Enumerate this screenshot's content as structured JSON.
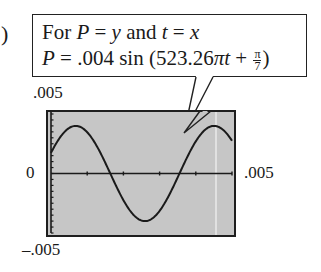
{
  "fragment": ")",
  "callout": {
    "line1": {
      "pre": "For ",
      "v1": "P",
      "eq1": " = ",
      "v2": "y",
      "mid": " and ",
      "v3": "t",
      "eq2": " = ",
      "v4": "x"
    },
    "line2": {
      "v1": "P",
      "eq": " = .004 sin (523.26",
      "pi": "π",
      "t": "t",
      "plus": " + ",
      "frac_num": "π",
      "frac_den": "7",
      "close": ")"
    }
  },
  "chart_data": {
    "type": "line",
    "xlabel": "t",
    "ylabel": "P",
    "xlim": [
      0,
      0.005
    ],
    "ylim": [
      -0.005,
      0.005
    ],
    "tick_labels": {
      "y_top": ".005",
      "y_bottom": "-.005",
      "x_left": "0",
      "x_right": ".005"
    },
    "amplitude": 0.004,
    "angular_coefficient": 523.26,
    "phase": "π/7",
    "x_ticks": 5,
    "y_ticks": 10,
    "grid": false,
    "samples": {
      "x": [
        0,
        0.0005,
        0.001,
        0.0015,
        0.002,
        0.0025,
        0.003,
        0.0035,
        0.004,
        0.0045,
        0.005
      ],
      "y": [
        0.0017,
        0.0039,
        0.0025,
        -0.0007,
        -0.0035,
        -0.0036,
        -0.0011,
        0.0022,
        0.004,
        0.0033,
        0.0004
      ]
    }
  },
  "labels": {
    "ytop": ".005",
    "y0": "0",
    "xr": ".005",
    "ybot": "–.005"
  },
  "colors": {
    "plot_bg": "#c6c6c6",
    "ink": "#1a1a1a"
  }
}
